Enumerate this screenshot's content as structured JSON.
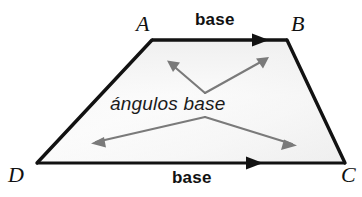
{
  "figure": {
    "kind": "geometry-diagram",
    "shape_name": "trapezoid",
    "background_color": "#ffffff",
    "outline_color": "#111111",
    "arrow_color": "#6e6e6e",
    "fill_gradient_light": "#ffffff",
    "fill_gradient_shade": "#d9d9d9"
  },
  "vertices": {
    "a": {
      "label": "A",
      "x": 152,
      "y": 40
    },
    "b": {
      "label": "B",
      "x": 287,
      "y": 40
    },
    "c": {
      "label": "C",
      "x": 345,
      "y": 163
    },
    "d": {
      "label": "D",
      "x": 37,
      "y": 163
    }
  },
  "labels": {
    "base_top": "base",
    "base_bottom": "base",
    "angles": "ángulos base"
  },
  "markers": {
    "top_base_arrow_tip_x": 268,
    "bottom_base_arrow_tip_x": 262
  }
}
